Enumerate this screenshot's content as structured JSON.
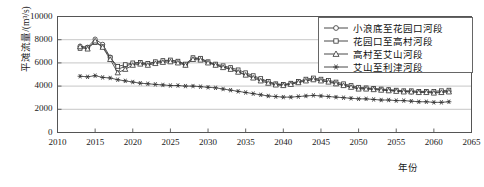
{
  "chart_data": {
    "type": "line",
    "title": "",
    "xlabel": "年份",
    "ylabel": "平滩流量/(m³/s)",
    "xlim": [
      2010,
      2065
    ],
    "ylim": [
      0,
      10000
    ],
    "xticks": [
      2010,
      2015,
      2020,
      2025,
      2030,
      2035,
      2040,
      2045,
      2050,
      2055,
      2060,
      2065
    ],
    "yticks": [
      0,
      2000,
      4000,
      6000,
      8000,
      10000
    ],
    "grid": true,
    "legend_position": "top-right",
    "x": [
      2013,
      2014,
      2015,
      2016,
      2017,
      2018,
      2019,
      2020,
      2021,
      2022,
      2023,
      2024,
      2025,
      2026,
      2027,
      2028,
      2029,
      2030,
      2031,
      2032,
      2033,
      2034,
      2035,
      2036,
      2037,
      2038,
      2039,
      2040,
      2041,
      2042,
      2043,
      2044,
      2045,
      2046,
      2047,
      2048,
      2049,
      2050,
      2051,
      2052,
      2053,
      2054,
      2055,
      2056,
      2057,
      2058,
      2059,
      2060,
      2061,
      2062
    ],
    "series": [
      {
        "name": "小浪底至花园口河段",
        "marker": "circle",
        "values": [
          7450,
          7350,
          8050,
          7600,
          6500,
          5450,
          5700,
          5950,
          6000,
          5900,
          6050,
          6150,
          6200,
          6100,
          5850,
          6400,
          6350,
          6050,
          5850,
          5650,
          5500,
          5250,
          5000,
          4800,
          4550,
          4350,
          4150,
          4100,
          4200,
          4350,
          4500,
          4600,
          4500,
          4400,
          4250,
          4100,
          3950,
          3800,
          3800,
          3750,
          3700,
          3650,
          3600,
          3550,
          3500,
          3500,
          3500,
          3450,
          3500,
          3550
        ]
      },
      {
        "name": "花园口至高村河段",
        "marker": "square",
        "values": [
          7250,
          7300,
          7750,
          7400,
          6450,
          5700,
          5850,
          6000,
          6050,
          5950,
          6100,
          6200,
          6250,
          6150,
          5900,
          6450,
          6400,
          6100,
          5900,
          5750,
          5600,
          5400,
          5150,
          4900,
          4650,
          4400,
          4200,
          4150,
          4250,
          4400,
          4600,
          4700,
          4600,
          4500,
          4350,
          4200,
          4050,
          3900,
          3850,
          3800,
          3750,
          3700,
          3650,
          3600,
          3600,
          3550,
          3550,
          3550,
          3600,
          3650
        ]
      },
      {
        "name": "高村至艾山河段",
        "marker": "triangle",
        "values": [
          7400,
          7200,
          7900,
          7350,
          6300,
          5150,
          5450,
          5800,
          5900,
          5800,
          5950,
          6050,
          6100,
          6000,
          5800,
          6300,
          6250,
          6000,
          5800,
          5600,
          5450,
          5200,
          4950,
          4700,
          4450,
          4250,
          4100,
          4050,
          4150,
          4300,
          4450,
          4550,
          4450,
          4350,
          4200,
          4050,
          3900,
          3750,
          3750,
          3700,
          3650,
          3600,
          3550,
          3500,
          3500,
          3450,
          3450,
          3400,
          3450,
          3500
        ]
      },
      {
        "name": "艾山至利津河段",
        "marker": "star",
        "values": [
          4850,
          4800,
          4900,
          4750,
          4700,
          4550,
          4450,
          4350,
          4250,
          4200,
          4150,
          4100,
          4050,
          4050,
          4000,
          4000,
          3950,
          3900,
          3850,
          3750,
          3650,
          3550,
          3450,
          3350,
          3250,
          3150,
          3100,
          3050,
          3050,
          3100,
          3150,
          3200,
          3150,
          3100,
          3050,
          3000,
          2950,
          2900,
          2900,
          2850,
          2800,
          2800,
          2750,
          2750,
          2700,
          2650,
          2650,
          2600,
          2600,
          2650
        ]
      }
    ]
  }
}
